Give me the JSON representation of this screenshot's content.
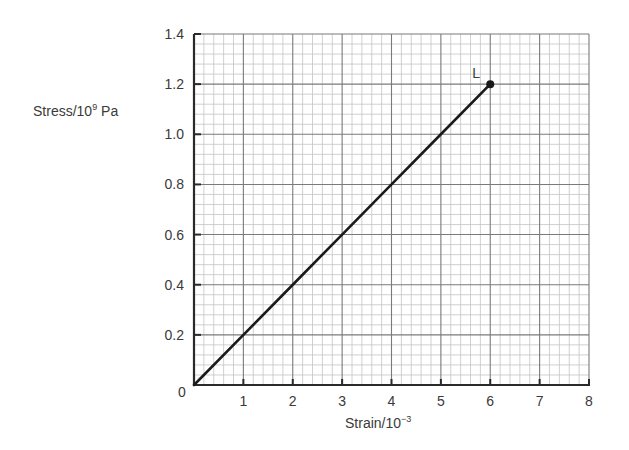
{
  "chart_data": {
    "type": "line",
    "title": "",
    "xlabel": "Strain/10",
    "xlabel_exponent": "−3",
    "ylabel": "Stress/10",
    "ylabel_exponent": "9",
    "ylabel_unit": " Pa",
    "xlim": [
      0,
      8
    ],
    "ylim": [
      0,
      1.4
    ],
    "x_ticks": [
      0,
      1,
      2,
      3,
      4,
      5,
      6,
      7,
      8
    ],
    "x_tick_labels": [
      "",
      "1",
      "2",
      "3",
      "4",
      "5",
      "6",
      "7",
      "8"
    ],
    "y_ticks": [
      0,
      0.2,
      0.4,
      0.6,
      0.8,
      1.0,
      1.2,
      1.4
    ],
    "y_tick_labels": [
      "0",
      "0.2",
      "0.4",
      "0.6",
      "0.8",
      "1.0",
      "1.2",
      "1.4"
    ],
    "grid": true,
    "grid_style": "graph paper: minor every 0.2 strain / 0.04 stress, major every 1 strain / 0.2 stress",
    "series": [
      {
        "name": "stress-strain",
        "x": [
          0,
          1,
          2,
          3,
          4,
          5,
          6
        ],
        "y": [
          0,
          0.2,
          0.4,
          0.6,
          0.8,
          1.0,
          1.2
        ],
        "color": "#1a1a1a"
      }
    ],
    "annotations": [
      {
        "text": "L",
        "x": 6,
        "y": 1.2,
        "marker": "filled-circle"
      }
    ]
  },
  "colors": {
    "line": "#1a1a1a",
    "axis": "#2a2a2a",
    "grid_major": "#7a7a7a",
    "grid_minor": "#c4c4c4",
    "text": "#3a3a3a"
  }
}
